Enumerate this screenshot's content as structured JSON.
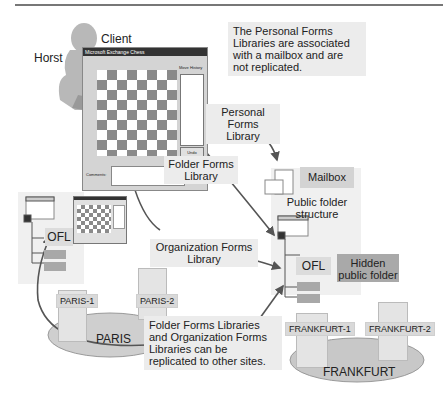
{
  "diagram": {
    "client": {
      "user_label": "Horst",
      "client_label": "Client",
      "app_window_title": "Microsoft Exchange Chess",
      "app_window_subtitle": "Exchange Chess",
      "move_history_label": "Move History",
      "undo_button": "Undo",
      "comments_label": "Comments:"
    },
    "notes": {
      "personal_note": "The Personal Forms Libraries are associated with a mailbox and are not replicated.",
      "replication_note": "Folder Forms Libraries and Organization Forms Libraries can be replicated to other sites."
    },
    "callouts": {
      "personal_forms_library": "Personal Forms Library",
      "folder_forms_library": "Folder Forms Library",
      "organization_forms_library": "Organization Forms Library"
    },
    "right_site": {
      "mailbox_label": "Mailbox",
      "public_folder_structure": "Public folder structure",
      "ofl_label": "OFL",
      "hidden_folder_label": "Hidden public folder",
      "servers": [
        "FRANKFURT-1",
        "FRANKFURT-2"
      ],
      "site_label": "FRANKFURT"
    },
    "left_site": {
      "ofl_label": "OFL",
      "servers": [
        "PARIS-1",
        "PARIS-2"
      ],
      "site_label": "PARIS"
    },
    "colors": {
      "arrow": "#555555",
      "callout_bg": "#ececec",
      "hidden_folder_bg": "#a9a9a9",
      "site_ellipse": "#cfcfcf"
    }
  }
}
